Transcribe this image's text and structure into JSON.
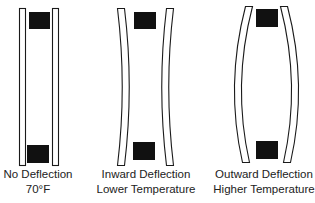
{
  "diagram": {
    "panels": [
      {
        "id": "no-deflection",
        "caption_line1": "No Deflection",
        "caption_line2": "70°F"
      },
      {
        "id": "inward-deflection",
        "caption_line1": "Inward Deflection",
        "caption_line2": "Lower Temperature"
      },
      {
        "id": "outward-deflection",
        "caption_line1": "Outward Deflection",
        "caption_line2": "Higher Temperature"
      }
    ],
    "colors": {
      "pane_stroke": "#1a1a1a",
      "spacer_fill": "#111111",
      "background": "#ffffff"
    }
  }
}
